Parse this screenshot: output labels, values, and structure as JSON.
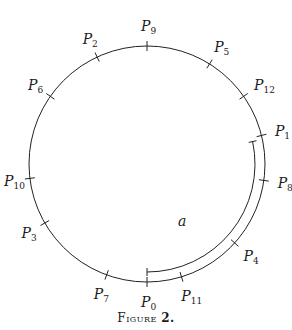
{
  "figure": {
    "caption_prefix": "Figure",
    "caption_number": "2.",
    "circle": {
      "cx": 147,
      "cy": 164,
      "r": 118,
      "stroke": "#222222"
    },
    "arc_label": "a",
    "points": [
      {
        "name": "P",
        "sub": "0",
        "angle_deg": 90
      },
      {
        "name": "P",
        "sub": "1",
        "angle_deg": -14
      },
      {
        "name": "P",
        "sub": "2",
        "angle_deg": -115
      },
      {
        "name": "P",
        "sub": "3",
        "angle_deg": 150
      },
      {
        "name": "P",
        "sub": "4",
        "angle_deg": 42
      },
      {
        "name": "P",
        "sub": "5",
        "angle_deg": -58
      },
      {
        "name": "P",
        "sub": "6",
        "angle_deg": -145
      },
      {
        "name": "P",
        "sub": "7",
        "angle_deg": 110
      },
      {
        "name": "P",
        "sub": "8",
        "angle_deg": 8
      },
      {
        "name": "P",
        "sub": "9",
        "angle_deg": -90
      },
      {
        "name": "P",
        "sub": "10",
        "angle_deg": 173
      },
      {
        "name": "P",
        "sub": "11",
        "angle_deg": 73
      },
      {
        "name": "P",
        "sub": "12",
        "angle_deg": -35
      }
    ],
    "arc": {
      "start_angle_deg": -12,
      "end_angle_deg": 90,
      "inner_r": 108
    }
  }
}
